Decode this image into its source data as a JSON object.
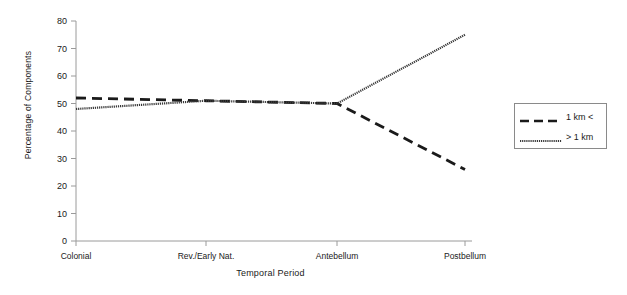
{
  "chart_data": {
    "type": "line",
    "title": "",
    "xlabel": "Temporal Period",
    "ylabel": "Percentage of Components",
    "categories": [
      "Colonial",
      "Rev./Early Nat.",
      "Antebellum",
      "Postbellum"
    ],
    "x_positions": [
      76,
      206,
      337,
      465
    ],
    "ylim": [
      0,
      80
    ],
    "yticks": [
      0,
      10,
      20,
      30,
      40,
      50,
      60,
      70,
      80
    ],
    "ytick_labels": [
      "0",
      "10",
      "20",
      "30",
      "40",
      "50",
      "60",
      "70",
      "80"
    ],
    "grid": false,
    "legend_position": "right-outside",
    "series": [
      {
        "name": "1 km <",
        "style": "dashed",
        "color": "#1a1a1a",
        "values": [
          52,
          51,
          50,
          26
        ]
      },
      {
        "name": "> 1 km",
        "style": "dotted",
        "color": "#3a3a3a",
        "values": [
          48,
          51,
          50,
          75
        ]
      }
    ]
  },
  "legend": {
    "entries": [
      {
        "label": "1 km <"
      },
      {
        "label": "> 1 km"
      }
    ]
  }
}
